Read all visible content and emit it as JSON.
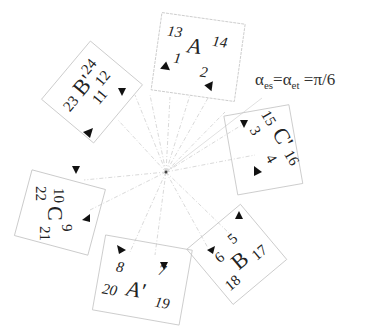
{
  "diagram": {
    "center": [
      166,
      172
    ],
    "formula": {
      "alpha1": "α",
      "sub1": "es",
      "eq1": "=",
      "alpha2": "α",
      "sub2": "et",
      "eq2": " =π/6"
    },
    "boxes": [
      {
        "id": "A",
        "phase": "A",
        "slots": [
          "1",
          "2"
        ],
        "ends": [
          "13",
          "14"
        ]
      },
      {
        "id": "C'",
        "phase": "C'",
        "slots": [
          "3",
          "4"
        ],
        "ends": [
          "15",
          "16"
        ]
      },
      {
        "id": "B",
        "phase": "B",
        "slots": [
          "5",
          "6"
        ],
        "ends": [
          "17",
          "18"
        ]
      },
      {
        "id": "A'",
        "phase": "A'",
        "slots": [
          "7",
          "8"
        ],
        "ends": [
          "19",
          "20"
        ]
      },
      {
        "id": "C",
        "phase": "C",
        "slots": [
          "9",
          "10"
        ],
        "ends": [
          "21",
          "22"
        ]
      },
      {
        "id": "B'",
        "phase": "B'",
        "slots": [
          "11",
          "12"
        ],
        "ends": [
          "23",
          "24"
        ]
      }
    ],
    "colors": {
      "box_border": "#bdbdbd",
      "ray": "#c8c8c8",
      "text": "#222222",
      "marker": "#111111"
    }
  }
}
